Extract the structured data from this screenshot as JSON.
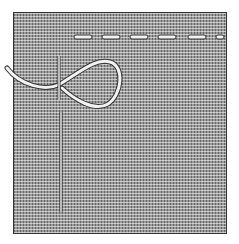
{
  "illustration": {
    "subject": "running stitch with needle and thread loop on woven fabric",
    "colors": {
      "background": "#ffffff",
      "fabric": "#9a9a9a",
      "border": "#333333",
      "thread": "#f2f2f2",
      "needle": "#e8e8e8"
    },
    "stitches": [
      {
        "x1": 74,
        "x2": 92
      },
      {
        "x1": 102,
        "x2": 120
      },
      {
        "x1": 130,
        "x2": 148
      },
      {
        "x1": 158,
        "x2": 176
      },
      {
        "x1": 188,
        "x2": 206
      },
      {
        "x1": 216,
        "x2": 224
      }
    ]
  }
}
